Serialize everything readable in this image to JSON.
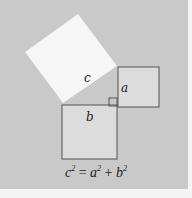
{
  "diagram": {
    "squares": [
      {
        "id": "c",
        "label": "c",
        "fill": "#f6f6f6"
      },
      {
        "id": "a",
        "label": "a",
        "fill": "#dcdcdc"
      },
      {
        "id": "b",
        "label": "b",
        "fill": "#dcdcdc"
      }
    ],
    "formula": {
      "c": "c",
      "c_exp": "2",
      "eq": " = ",
      "a": "a",
      "a_exp": "2",
      "plus": " + ",
      "b": "b",
      "b_exp": "2"
    },
    "colors": {
      "background": "#c9c9c9",
      "outer": "#f4f4f4",
      "stroke": "#555555"
    }
  }
}
